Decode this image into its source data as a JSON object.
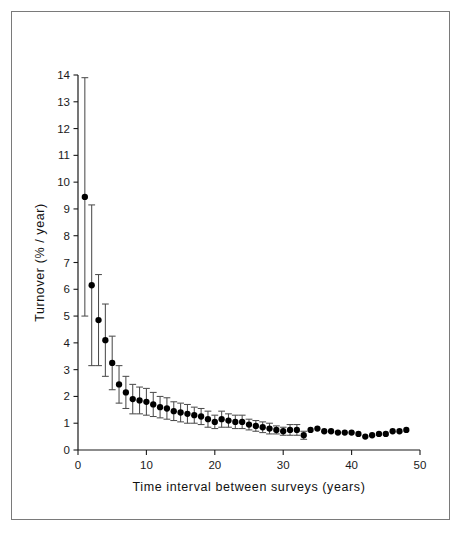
{
  "figure": {
    "background_color": "#ffffff",
    "frame_color": "#7a7a7a",
    "marker_color": "#000000",
    "errorbar_color": "#4d4d4d"
  },
  "chart_data": {
    "type": "scatter",
    "title": "",
    "xlabel": "Time interval between surveys (years)",
    "ylabel": "Turnover (% / year)",
    "xlim": [
      0,
      50
    ],
    "ylim": [
      0,
      14
    ],
    "xticks": [
      0,
      10,
      20,
      30,
      40,
      50
    ],
    "xtick_labels": [
      "0",
      "10",
      "20",
      "30",
      "40",
      "50"
    ],
    "yticks": [
      0,
      1,
      2,
      3,
      4,
      5,
      6,
      7,
      8,
      9,
      10,
      11,
      12,
      13,
      14
    ],
    "ytick_labels": [
      "0",
      "1",
      "2",
      "3",
      "4",
      "5",
      "6",
      "7",
      "8",
      "9",
      "10",
      "11",
      "12",
      "13",
      "14"
    ],
    "grid": false,
    "legend": null,
    "marker": "filled-circle",
    "errorbars": "vertical-with-caps",
    "series": [
      {
        "name": "Turnover vs survey interval",
        "x": [
          1,
          2,
          3,
          4,
          5,
          6,
          7,
          8,
          9,
          10,
          11,
          12,
          13,
          14,
          15,
          16,
          17,
          18,
          19,
          20,
          21,
          22,
          23,
          24,
          25,
          26,
          27,
          28,
          29,
          30,
          31,
          32,
          33,
          34,
          35,
          36,
          37,
          38,
          39,
          40,
          41,
          42,
          43,
          44,
          45,
          46,
          47,
          48
        ],
        "y": [
          9.45,
          6.15,
          4.85,
          4.1,
          3.25,
          2.45,
          2.15,
          1.9,
          1.85,
          1.8,
          1.7,
          1.6,
          1.55,
          1.45,
          1.4,
          1.35,
          1.3,
          1.25,
          1.15,
          1.05,
          1.15,
          1.1,
          1.05,
          1.05,
          0.95,
          0.9,
          0.85,
          0.8,
          0.75,
          0.7,
          0.75,
          0.75,
          0.55,
          0.75,
          0.8,
          0.7,
          0.7,
          0.65,
          0.65,
          0.65,
          0.6,
          0.5,
          0.55,
          0.6,
          0.6,
          0.7,
          0.7,
          0.75
        ],
        "yerr_low": [
          4.45,
          3.0,
          1.7,
          1.35,
          1.0,
          0.7,
          0.6,
          0.55,
          0.5,
          0.5,
          0.45,
          0.4,
          0.4,
          0.35,
          0.35,
          0.35,
          0.3,
          0.3,
          0.3,
          0.25,
          0.3,
          0.25,
          0.25,
          0.25,
          0.2,
          0.2,
          0.2,
          0.2,
          0.15,
          0.15,
          0.2,
          0.2,
          0.15,
          0.0,
          0.0,
          0.0,
          0.0,
          0.0,
          0.0,
          0.0,
          0.0,
          0.0,
          0.0,
          0.0,
          0.0,
          0.0,
          0.0,
          0.0
        ],
        "yerr_high": [
          4.45,
          3.0,
          1.7,
          1.35,
          1.0,
          0.7,
          0.6,
          0.55,
          0.5,
          0.5,
          0.45,
          0.4,
          0.4,
          0.35,
          0.35,
          0.35,
          0.3,
          0.3,
          0.3,
          0.25,
          0.3,
          0.25,
          0.25,
          0.25,
          0.2,
          0.2,
          0.2,
          0.2,
          0.15,
          0.15,
          0.2,
          0.2,
          0.15,
          0.0,
          0.0,
          0.0,
          0.0,
          0.0,
          0.0,
          0.0,
          0.0,
          0.0,
          0.0,
          0.0,
          0.0,
          0.0,
          0.0,
          0.0
        ]
      }
    ]
  }
}
